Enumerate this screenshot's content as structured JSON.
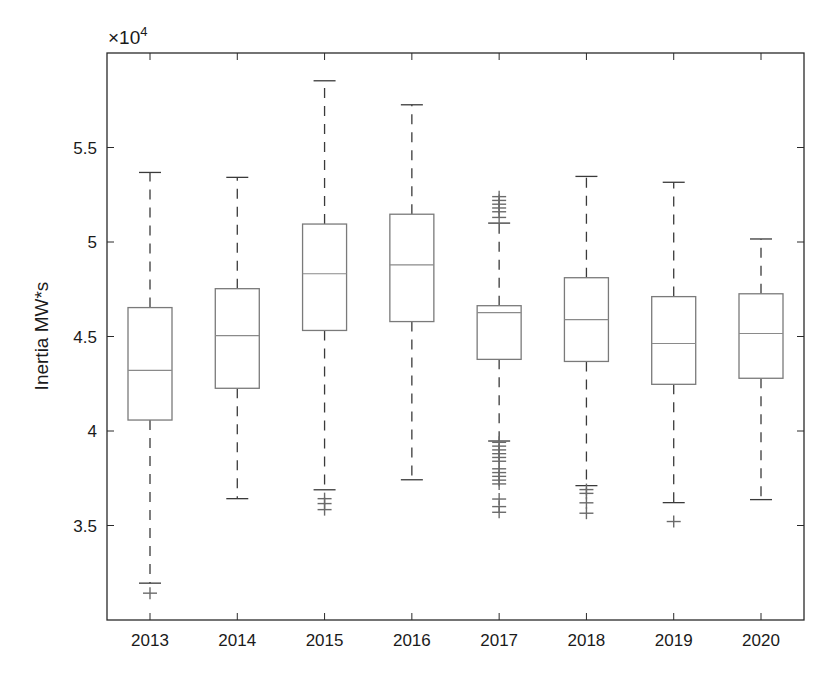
{
  "chart_data": {
    "type": "boxplot",
    "title": "",
    "xlabel": "",
    "ylabel": "Inertia MW*s",
    "y_exponent_label": "×10",
    "y_exponent": "4",
    "y_scale": 10000,
    "ylim": [
      3.0,
      6.0
    ],
    "yticks": [
      3.5,
      4,
      4.5,
      5,
      5.5
    ],
    "ytick_labels": [
      "3.5",
      "4",
      "4.5",
      "5",
      "5.5"
    ],
    "grid": false,
    "legend": null,
    "categories": [
      "2013",
      "2014",
      "2015",
      "2016",
      "2017",
      "2018",
      "2019",
      "2020"
    ],
    "series": [
      {
        "name": "2013",
        "whisker_low": 3.195,
        "q1": 4.058,
        "median": 4.321,
        "q3": 4.653,
        "whisker_high": 5.368,
        "outliers": [
          3.142
        ]
      },
      {
        "name": "2014",
        "whisker_low": 3.642,
        "q1": 4.226,
        "median": 4.505,
        "q3": 4.753,
        "whisker_high": 5.342,
        "outliers": []
      },
      {
        "name": "2015",
        "whisker_low": 3.689,
        "q1": 4.532,
        "median": 4.832,
        "q3": 5.095,
        "whisker_high": 5.853,
        "outliers": [
          3.642,
          3.616,
          3.584
        ]
      },
      {
        "name": "2016",
        "whisker_low": 3.742,
        "q1": 4.579,
        "median": 4.879,
        "q3": 5.147,
        "whisker_high": 5.726,
        "outliers": []
      },
      {
        "name": "2017",
        "whisker_low": 3.947,
        "q1": 4.379,
        "median": 4.626,
        "q3": 4.663,
        "whisker_high": 5.1,
        "outliers": [
          5.13,
          5.16,
          5.18,
          5.2,
          5.22,
          5.24,
          3.94,
          3.92,
          3.9,
          3.88,
          3.86,
          3.84,
          3.8,
          3.78,
          3.76,
          3.74,
          3.72,
          3.64,
          3.6,
          3.57
        ]
      },
      {
        "name": "2018",
        "whisker_low": 3.711,
        "q1": 4.368,
        "median": 4.589,
        "q3": 4.811,
        "whisker_high": 5.347,
        "outliers": [
          3.69,
          3.67,
          3.62,
          3.565
        ]
      },
      {
        "name": "2019",
        "whisker_low": 3.621,
        "q1": 4.247,
        "median": 4.463,
        "q3": 4.711,
        "whisker_high": 5.316,
        "outliers": [
          3.521
        ]
      },
      {
        "name": "2020",
        "whisker_low": 3.637,
        "q1": 4.279,
        "median": 4.516,
        "q3": 4.726,
        "whisker_high": 5.016,
        "outliers": []
      }
    ],
    "colors": {
      "box": "#7a7a7a",
      "whisker": "#3a3a3a",
      "median": "#8a8a8a",
      "outlier": "#6a6a6a",
      "axis": "#2a2a2a"
    }
  }
}
